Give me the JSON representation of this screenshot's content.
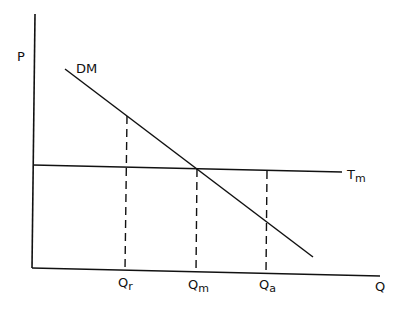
{
  "diagram": {
    "type": "economics supply-demand style diagram",
    "axes": {
      "y_label": "P",
      "x_label": "Q"
    },
    "curves": {
      "demand": {
        "label": "DM",
        "style": "solid",
        "slope": "downward"
      },
      "threshold": {
        "label_main": "T",
        "label_sub": "m",
        "style": "solid",
        "slope": "horizontal"
      }
    },
    "markers": [
      {
        "label_main": "Q",
        "label_sub": "r",
        "style": "dashed"
      },
      {
        "label_main": "Q",
        "label_sub": "m",
        "style": "dashed"
      },
      {
        "label_main": "Q",
        "label_sub": "a",
        "style": "dashed"
      }
    ],
    "colors": {
      "line": "#111111",
      "background": "#ffffff"
    }
  }
}
